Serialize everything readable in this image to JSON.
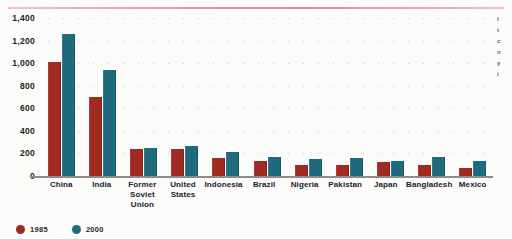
{
  "decor": {
    "top_rule_color": "#e28db0",
    "side_text_lines": [
      "I",
      "t",
      "c",
      "n",
      "y",
      "i"
    ]
  },
  "legend": {
    "items": [
      {
        "label": "1985",
        "color": "#9e2a22",
        "swatch": "circle-swatch-1985"
      },
      {
        "label": "2000",
        "color": "#1f6b7d",
        "swatch": "circle-swatch-2000"
      }
    ]
  },
  "chart_data": {
    "type": "bar",
    "title": "",
    "xlabel": "",
    "ylabel": "",
    "ylim": [
      0,
      1400
    ],
    "ytick_labels": [
      "1,400",
      "1,200",
      "1,000",
      "800",
      "600",
      "400",
      "200",
      "0"
    ],
    "ytick_values": [
      1400,
      1200,
      1000,
      800,
      600,
      400,
      200,
      0
    ],
    "grid": true,
    "grid_style": "dotted",
    "legend_position": "bottom-left",
    "categories": [
      "China",
      "India",
      "Former Soviet Union",
      "United States",
      "Indonesia",
      "Brazil",
      "Nigeria",
      "Pakistan",
      "Japan",
      "Bangladesh",
      "Mexico"
    ],
    "category_labels": [
      "China",
      "India",
      "Former\nSoviet\nUnion",
      "United\nStates",
      "Indonesia",
      "Brazil",
      "Nigeria",
      "Pakistan",
      "Japan",
      "Bangladesh",
      "Mexico"
    ],
    "series": [
      {
        "name": "1985",
        "color": "#9e2a22",
        "values": [
          1010,
          700,
          240,
          235,
          160,
          135,
          95,
          100,
          120,
          100,
          75
        ]
      },
      {
        "name": "2000",
        "color": "#1f6b7d",
        "values": [
          1260,
          940,
          250,
          270,
          210,
          165,
          150,
          160,
          130,
          165,
          130
        ]
      }
    ]
  }
}
